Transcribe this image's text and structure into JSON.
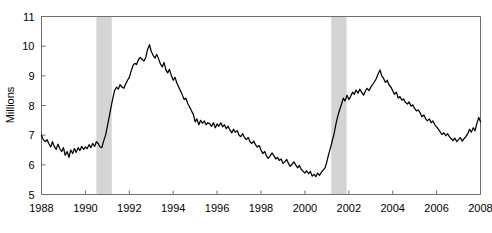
{
  "chart_data": {
    "type": "line",
    "title": "",
    "subtitle": "",
    "xlabel": "",
    "ylabel": "Millions",
    "xlim": [
      1988,
      2008
    ],
    "ylim": [
      5,
      11
    ],
    "grid": false,
    "legend": null,
    "legend_position": "none",
    "line_color": "#000000",
    "background_color": "#ffffff",
    "axis_color": "#6e6e6e",
    "y_ticks": [
      5,
      6,
      7,
      8,
      9,
      10,
      11
    ],
    "y_tick_labels": [
      "5",
      "6",
      "7",
      "8",
      "9",
      "10",
      "11"
    ],
    "x_ticks": [
      1988,
      1990,
      1992,
      1994,
      1996,
      1998,
      2000,
      2002,
      2004,
      2006,
      2008
    ],
    "x_tick_labels": [
      "1988",
      "1990",
      "1992",
      "1994",
      "1996",
      "1998",
      "2000",
      "2002",
      "2004",
      "2006",
      "2008"
    ],
    "annotations": [
      {
        "type": "shaded-band",
        "name": "recession-1990-1991",
        "x_start": 1990.5,
        "x_end": 1991.2,
        "color": "#d4d4d4"
      },
      {
        "type": "shaded-band",
        "name": "recession-2001",
        "x_start": 2001.2,
        "x_end": 2001.9,
        "color": "#d4d4d4"
      }
    ],
    "series": [
      {
        "name": "Unemployment level",
        "color": "#000000",
        "x": [
          1988.0,
          1988.08,
          1988.17,
          1988.25,
          1988.33,
          1988.42,
          1988.5,
          1988.58,
          1988.67,
          1988.75,
          1988.83,
          1988.92,
          1989.0,
          1989.08,
          1989.17,
          1989.25,
          1989.33,
          1989.42,
          1989.5,
          1989.58,
          1989.67,
          1989.75,
          1989.83,
          1989.92,
          1990.0,
          1990.08,
          1990.17,
          1990.25,
          1990.33,
          1990.42,
          1990.5,
          1990.58,
          1990.67,
          1990.75,
          1990.83,
          1990.92,
          1991.0,
          1991.08,
          1991.17,
          1991.25,
          1991.33,
          1991.42,
          1991.5,
          1991.58,
          1991.67,
          1991.75,
          1991.83,
          1991.92,
          1992.0,
          1992.08,
          1992.17,
          1992.25,
          1992.33,
          1992.42,
          1992.5,
          1992.58,
          1992.67,
          1992.75,
          1992.83,
          1992.92,
          1993.0,
          1993.08,
          1993.17,
          1993.25,
          1993.33,
          1993.42,
          1993.5,
          1993.58,
          1993.67,
          1993.75,
          1993.83,
          1993.92,
          1994.0,
          1994.08,
          1994.17,
          1994.25,
          1994.33,
          1994.42,
          1994.5,
          1994.58,
          1994.67,
          1994.75,
          1994.83,
          1994.92,
          1995.0,
          1995.08,
          1995.17,
          1995.25,
          1995.33,
          1995.42,
          1995.5,
          1995.58,
          1995.67,
          1995.75,
          1995.83,
          1995.92,
          1996.0,
          1996.08,
          1996.17,
          1996.25,
          1996.33,
          1996.42,
          1996.5,
          1996.58,
          1996.67,
          1996.75,
          1996.83,
          1996.92,
          1997.0,
          1997.08,
          1997.17,
          1997.25,
          1997.33,
          1997.42,
          1997.5,
          1997.58,
          1997.67,
          1997.75,
          1997.83,
          1997.92,
          1998.0,
          1998.08,
          1998.17,
          1998.25,
          1998.33,
          1998.42,
          1998.5,
          1998.58,
          1998.67,
          1998.75,
          1998.83,
          1998.92,
          1999.0,
          1999.08,
          1999.17,
          1999.25,
          1999.33,
          1999.42,
          1999.5,
          1999.58,
          1999.67,
          1999.75,
          1999.83,
          1999.92,
          2000.0,
          2000.08,
          2000.17,
          2000.25,
          2000.33,
          2000.42,
          2000.5,
          2000.58,
          2000.67,
          2000.75,
          2000.83,
          2000.92,
          2001.0,
          2001.08,
          2001.17,
          2001.25,
          2001.33,
          2001.42,
          2001.5,
          2001.58,
          2001.67,
          2001.75,
          2001.83,
          2001.92,
          2002.0,
          2002.08,
          2002.17,
          2002.25,
          2002.33,
          2002.42,
          2002.5,
          2002.58,
          2002.67,
          2002.75,
          2002.83,
          2002.92,
          2003.0,
          2003.08,
          2003.17,
          2003.25,
          2003.33,
          2003.42,
          2003.5,
          2003.58,
          2003.67,
          2003.75,
          2003.83,
          2003.92,
          2004.0,
          2004.08,
          2004.17,
          2004.25,
          2004.33,
          2004.42,
          2004.5,
          2004.58,
          2004.67,
          2004.75,
          2004.83,
          2004.92,
          2005.0,
          2005.08,
          2005.17,
          2005.25,
          2005.33,
          2005.42,
          2005.5,
          2005.58,
          2005.67,
          2005.75,
          2005.83,
          2005.92,
          2006.0,
          2006.08,
          2006.17,
          2006.25,
          2006.33,
          2006.42,
          2006.5,
          2006.58,
          2006.67,
          2006.75,
          2006.83,
          2006.92,
          2007.0,
          2007.08,
          2007.17,
          2007.25,
          2007.33,
          2007.42,
          2007.5,
          2007.58,
          2007.67,
          2007.75,
          2007.83,
          2007.92,
          2008.0
        ],
        "values": [
          7.0,
          6.85,
          6.78,
          6.85,
          6.72,
          6.6,
          6.78,
          6.62,
          6.52,
          6.7,
          6.55,
          6.45,
          6.58,
          6.32,
          6.45,
          6.25,
          6.5,
          6.38,
          6.55,
          6.42,
          6.58,
          6.48,
          6.62,
          6.52,
          6.6,
          6.55,
          6.68,
          6.58,
          6.72,
          6.62,
          6.78,
          6.72,
          6.6,
          6.58,
          6.8,
          7.0,
          7.3,
          7.6,
          7.95,
          8.25,
          8.5,
          8.62,
          8.55,
          8.7,
          8.62,
          8.58,
          8.72,
          8.85,
          8.95,
          9.15,
          9.35,
          9.42,
          9.38,
          9.55,
          9.62,
          9.55,
          9.5,
          9.62,
          9.88,
          10.05,
          9.82,
          9.7,
          9.6,
          9.72,
          9.58,
          9.4,
          9.3,
          9.45,
          9.2,
          9.1,
          9.22,
          9.0,
          8.85,
          8.95,
          8.75,
          8.62,
          8.5,
          8.35,
          8.2,
          8.25,
          8.05,
          7.95,
          7.82,
          7.7,
          7.45,
          7.55,
          7.35,
          7.5,
          7.4,
          7.48,
          7.35,
          7.42,
          7.38,
          7.3,
          7.42,
          7.25,
          7.38,
          7.3,
          7.42,
          7.28,
          7.35,
          7.22,
          7.3,
          7.18,
          7.08,
          7.2,
          7.1,
          7.15,
          7.0,
          6.95,
          7.05,
          6.92,
          6.85,
          6.92,
          6.78,
          6.72,
          6.8,
          6.68,
          6.6,
          6.65,
          6.5,
          6.38,
          6.45,
          6.3,
          6.22,
          6.3,
          6.4,
          6.32,
          6.2,
          6.25,
          6.15,
          6.2,
          6.05,
          6.1,
          6.18,
          6.05,
          5.95,
          6.02,
          6.1,
          6.0,
          5.9,
          5.98,
          5.85,
          5.78,
          5.72,
          5.8,
          5.7,
          5.78,
          5.62,
          5.68,
          5.6,
          5.72,
          5.65,
          5.75,
          5.82,
          5.9,
          6.1,
          6.35,
          6.58,
          6.82,
          7.05,
          7.4,
          7.65,
          7.85,
          8.05,
          8.25,
          8.15,
          8.35,
          8.2,
          8.3,
          8.45,
          8.38,
          8.52,
          8.42,
          8.55,
          8.45,
          8.35,
          8.48,
          8.58,
          8.5,
          8.62,
          8.7,
          8.8,
          8.9,
          9.05,
          9.2,
          9.0,
          8.92,
          8.78,
          8.85,
          8.7,
          8.62,
          8.5,
          8.38,
          8.45,
          8.25,
          8.3,
          8.18,
          8.22,
          8.1,
          8.05,
          8.12,
          7.98,
          8.02,
          7.9,
          7.82,
          7.85,
          7.75,
          7.62,
          7.68,
          7.55,
          7.48,
          7.55,
          7.42,
          7.48,
          7.35,
          7.28,
          7.2,
          7.1,
          7.02,
          7.08,
          6.98,
          7.05,
          6.95,
          6.88,
          6.82,
          6.9,
          6.78,
          6.85,
          6.92,
          6.8,
          6.88,
          6.95,
          7.05,
          7.2,
          7.1,
          7.25,
          7.15,
          7.38,
          7.6,
          7.45
        ]
      }
    ]
  }
}
